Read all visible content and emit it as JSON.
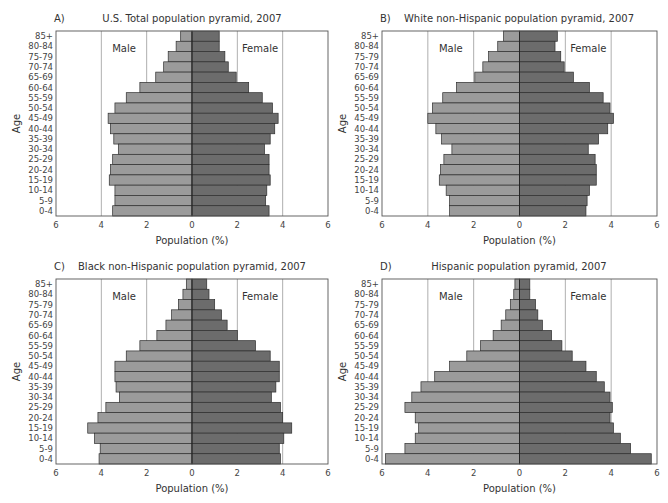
{
  "figure": {
    "age_groups": [
      "85+",
      "80-84",
      "75-79",
      "70-74",
      "65-69",
      "60-64",
      "55-59",
      "50-54",
      "45-49",
      "40-44",
      "35-39",
      "30-34",
      "25-29",
      "20-24",
      "15-19",
      "10-14",
      "5-9",
      "0-4"
    ],
    "x_ticks": [
      "6",
      "4",
      "2",
      "0",
      "2",
      "4",
      "6"
    ],
    "xlabel": "Population (%)",
    "ylabel": "Age",
    "male_label": "Male",
    "female_label": "Female",
    "colors": {
      "male": "#9b9b9b",
      "female": "#6c6c6c",
      "border": "#2e2e2e",
      "grid": "#9a9a9a",
      "frame": "#555555"
    }
  },
  "chart_data": [
    {
      "panel": "A)",
      "type": "bar",
      "subtype": "population-pyramid",
      "title": "U.S. Total population pyramid, 2007",
      "xlabel": "Population (%)",
      "ylabel": "Age",
      "xlim": [
        -6,
        6
      ],
      "categories": [
        "0-4",
        "5-9",
        "10-14",
        "15-19",
        "20-24",
        "25-29",
        "30-34",
        "35-39",
        "40-44",
        "45-49",
        "50-54",
        "55-59",
        "60-64",
        "65-69",
        "70-74",
        "75-79",
        "80-84",
        "85+"
      ],
      "series": [
        {
          "name": "Male",
          "values": [
            3.5,
            3.4,
            3.4,
            3.65,
            3.6,
            3.5,
            3.25,
            3.45,
            3.6,
            3.7,
            3.4,
            2.9,
            2.3,
            1.6,
            1.25,
            1.05,
            0.7,
            0.5
          ]
        },
        {
          "name": "Female",
          "values": [
            3.4,
            3.25,
            3.3,
            3.45,
            3.4,
            3.4,
            3.2,
            3.45,
            3.65,
            3.8,
            3.55,
            3.1,
            2.5,
            1.95,
            1.6,
            1.45,
            1.2,
            1.2
          ]
        }
      ],
      "legend_labels": [
        "Male",
        "Female"
      ],
      "grid": "vertical at ±2, ±4"
    },
    {
      "panel": "B)",
      "type": "bar",
      "subtype": "population-pyramid",
      "title": "White non-Hispanic population pyramid, 2007",
      "xlabel": "Population (%)",
      "ylabel": "Age",
      "xlim": [
        -6,
        6
      ],
      "categories": [
        "0-4",
        "5-9",
        "10-14",
        "15-19",
        "20-24",
        "25-29",
        "30-34",
        "35-39",
        "40-44",
        "45-49",
        "50-54",
        "55-59",
        "60-64",
        "65-69",
        "70-74",
        "75-79",
        "80-84",
        "85+"
      ],
      "series": [
        {
          "name": "Male",
          "values": [
            3.05,
            3.05,
            3.2,
            3.5,
            3.45,
            3.3,
            2.95,
            3.4,
            3.65,
            4.0,
            3.8,
            3.35,
            2.75,
            1.95,
            1.6,
            1.35,
            0.95,
            0.7
          ]
        },
        {
          "name": "Female",
          "values": [
            2.9,
            2.95,
            3.05,
            3.35,
            3.35,
            3.3,
            3.0,
            3.45,
            3.85,
            4.1,
            3.95,
            3.65,
            3.05,
            2.35,
            1.95,
            1.8,
            1.55,
            1.65
          ]
        }
      ],
      "legend_labels": [
        "Male",
        "Female"
      ],
      "grid": "vertical at ±2, ±4"
    },
    {
      "panel": "C)",
      "type": "bar",
      "subtype": "population-pyramid",
      "title": "Black non-Hispanic population pyramid, 2007",
      "xlabel": "Population (%)",
      "ylabel": "Age",
      "xlim": [
        -6,
        6
      ],
      "categories": [
        "0-4",
        "5-9",
        "10-14",
        "15-19",
        "20-24",
        "25-29",
        "30-34",
        "35-39",
        "40-44",
        "45-49",
        "50-54",
        "55-59",
        "60-64",
        "65-69",
        "70-74",
        "75-79",
        "80-84",
        "85+"
      ],
      "series": [
        {
          "name": "Male",
          "values": [
            4.1,
            4.05,
            4.3,
            4.6,
            4.15,
            3.8,
            3.2,
            3.35,
            3.4,
            3.4,
            2.9,
            2.3,
            1.55,
            1.15,
            0.9,
            0.6,
            0.4,
            0.25
          ]
        },
        {
          "name": "Female",
          "values": [
            3.9,
            3.85,
            4.05,
            4.4,
            4.0,
            3.9,
            3.5,
            3.7,
            3.85,
            3.85,
            3.45,
            2.8,
            2.0,
            1.55,
            1.3,
            1.0,
            0.75,
            0.65
          ]
        }
      ],
      "legend_labels": [
        "Male",
        "Female"
      ],
      "grid": "vertical at ±2, ±4"
    },
    {
      "panel": "D)",
      "type": "bar",
      "subtype": "population-pyramid",
      "title": "Hispanic population pyramid, 2007",
      "xlabel": "Population (%)",
      "ylabel": "Age",
      "xlim": [
        -6,
        6
      ],
      "categories": [
        "0-4",
        "5-9",
        "10-14",
        "15-19",
        "20-24",
        "25-29",
        "30-34",
        "35-39",
        "40-44",
        "45-49",
        "50-54",
        "55-59",
        "60-64",
        "65-69",
        "70-74",
        "75-79",
        "80-84",
        "85+"
      ],
      "series": [
        {
          "name": "Male",
          "values": [
            5.85,
            5.0,
            4.55,
            4.4,
            4.55,
            5.0,
            4.7,
            4.3,
            3.7,
            3.05,
            2.3,
            1.7,
            1.15,
            0.8,
            0.6,
            0.4,
            0.25,
            0.2
          ]
        },
        {
          "name": "Female",
          "values": [
            5.75,
            4.85,
            4.4,
            4.1,
            3.95,
            4.05,
            3.95,
            3.7,
            3.35,
            2.9,
            2.3,
            1.85,
            1.4,
            1.0,
            0.8,
            0.7,
            0.45,
            0.45
          ]
        }
      ],
      "legend_labels": [
        "Male",
        "Female"
      ],
      "grid": "vertical at ±2, ±4"
    }
  ],
  "layout": {
    "panels": [
      {
        "left": 0,
        "top": 0,
        "frame": {
          "x": 56,
          "y": 31,
          "w": 272,
          "h": 185
        },
        "title_x": 192,
        "panel_label_x": 54
      },
      {
        "left": 334,
        "top": 0,
        "frame": {
          "x": 48,
          "y": 31,
          "w": 275,
          "h": 185
        },
        "title_x": 185,
        "panel_label_x": 46
      },
      {
        "left": 0,
        "top": 248,
        "frame": {
          "x": 56,
          "y": 31,
          "w": 272,
          "h": 185
        },
        "title_x": 192,
        "panel_label_x": 54
      },
      {
        "left": 334,
        "top": 248,
        "frame": {
          "x": 48,
          "y": 31,
          "w": 275,
          "h": 185
        },
        "title_x": 185,
        "panel_label_x": 46
      }
    ]
  }
}
